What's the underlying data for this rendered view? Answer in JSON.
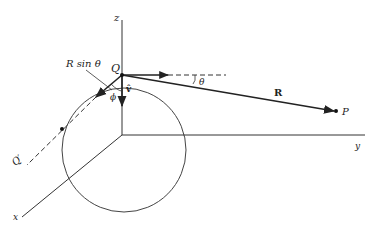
{
  "diagram": {
    "labels": {
      "z_axis": "z",
      "y_axis": "y",
      "x_axis": "x",
      "point_q": "Q",
      "point_q_prime": "Q′",
      "point_p": "P",
      "vector_r": "R",
      "r_sin_theta": "R sin θ",
      "theta": "θ",
      "phi": "ϕ",
      "v_hat": "v̂"
    },
    "colors": {
      "line": "#222222",
      "background": "#ffffff"
    }
  }
}
